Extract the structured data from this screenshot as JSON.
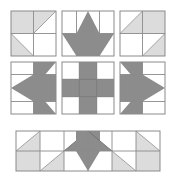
{
  "figure": {
    "width": 176,
    "height": 177
  },
  "palette": {
    "white": "#ffffff",
    "light_gray": "#dcdcdc",
    "dark_gray": "#8c8c8c",
    "line": "#8a8a8a",
    "line_light": "#b5b5b5",
    "background": "#ffffff"
  },
  "layout": {
    "rows": [
      {
        "name": "top-row",
        "blocks": [
          "corner-block-tl",
          "star-block-top",
          "corner-block-tr"
        ]
      },
      {
        "name": "middle-row",
        "blocks": [
          "arrow-block-left",
          "cross-block-center",
          "arrow-block-right"
        ]
      },
      {
        "name": "bottom-row",
        "blocks": [
          "border-strip-bottom"
        ]
      }
    ]
  },
  "blocks": [
    {
      "id": "corner-block-tl",
      "name": "corner-block-top-left",
      "grid": "2x2",
      "x": 11,
      "y": 11,
      "w": 45,
      "h": 45,
      "cells": [
        {
          "pos": "top-left",
          "fill": "light_gray",
          "shape": "square"
        },
        {
          "pos": "top-right",
          "fill": "light_gray",
          "shape": "half-square-triangle",
          "orient": "upper-left"
        },
        {
          "pos": "bottom-left",
          "fill": "light_gray",
          "shape": "half-square-triangle",
          "orient": "lower-left"
        },
        {
          "pos": "bottom-right",
          "fill": "white",
          "shape": "square"
        }
      ]
    },
    {
      "id": "star-block-top",
      "name": "star-block-top-middle",
      "grid": "3x2",
      "x": 62,
      "y": 11,
      "w": 52,
      "h": 45,
      "motif": "up-arrow-star",
      "fill": "dark_gray"
    },
    {
      "id": "corner-block-tr",
      "name": "corner-block-top-right",
      "grid": "2x2",
      "x": 120,
      "y": 11,
      "w": 45,
      "h": 45,
      "cells": [
        {
          "pos": "top-left",
          "fill": "light_gray",
          "shape": "half-square-triangle",
          "orient": "upper-right"
        },
        {
          "pos": "top-right",
          "fill": "light_gray",
          "shape": "square"
        },
        {
          "pos": "bottom-left",
          "fill": "white",
          "shape": "square"
        },
        {
          "pos": "bottom-right",
          "fill": "light_gray",
          "shape": "half-square-triangle",
          "orient": "lower-right"
        }
      ]
    },
    {
      "id": "arrow-block-left",
      "name": "arrow-block-middle-left",
      "grid": "3x3",
      "x": 11,
      "y": 62,
      "w": 45,
      "h": 52,
      "motif": "left-arrow-star",
      "fill": "dark_gray"
    },
    {
      "id": "cross-block-center",
      "name": "cross-block-center",
      "grid": "3x3",
      "x": 62,
      "y": 62,
      "w": 52,
      "h": 52,
      "motif": "plus-cross",
      "fill": "dark_gray",
      "cells": [
        {
          "pos": "top-left",
          "fill": "white"
        },
        {
          "pos": "top-center",
          "fill": "dark_gray"
        },
        {
          "pos": "top-right",
          "fill": "white"
        },
        {
          "pos": "middle-left",
          "fill": "dark_gray"
        },
        {
          "pos": "middle-center",
          "fill": "dark_gray"
        },
        {
          "pos": "middle-right",
          "fill": "dark_gray"
        },
        {
          "pos": "bottom-left",
          "fill": "white"
        },
        {
          "pos": "bottom-center",
          "fill": "dark_gray"
        },
        {
          "pos": "bottom-right",
          "fill": "white"
        }
      ]
    },
    {
      "id": "arrow-block-right",
      "name": "arrow-block-middle-right",
      "grid": "3x3",
      "x": 120,
      "y": 62,
      "w": 45,
      "h": 52,
      "motif": "right-arrow-star",
      "fill": "dark_gray"
    },
    {
      "id": "border-strip-bottom",
      "name": "border-strip-bottom",
      "grid": "6x2",
      "x": 16,
      "y": 131,
      "w": 144,
      "h": 40,
      "motif": "down-arrow-with-corner-triangles",
      "fills": [
        "light_gray",
        "dark_gray"
      ]
    }
  ]
}
